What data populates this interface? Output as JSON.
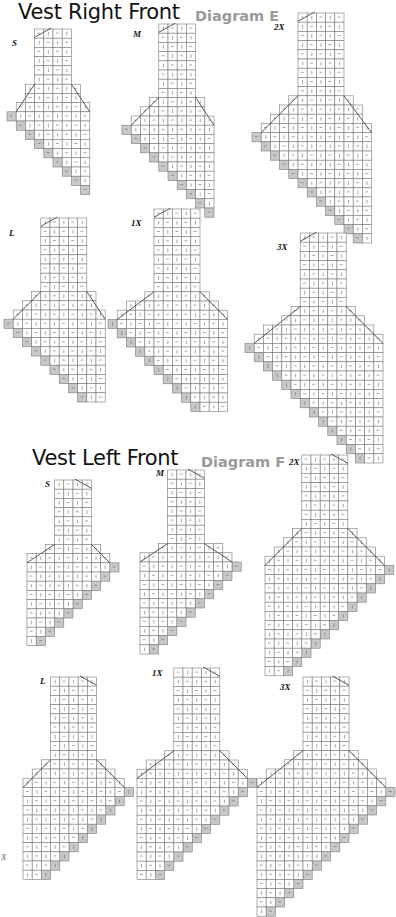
{
  "sections": [
    {
      "title": "Vest Right Front",
      "subtitle": "Diagram E"
    },
    {
      "title": "Vest Left Front",
      "subtitle": "Diagram F"
    }
  ],
  "stray_text": "X",
  "colors": {
    "line": "#7a7a7a",
    "outline": "#444444",
    "grey_cell": "#c8c8c8",
    "mark": "#666666"
  },
  "diagrams": [
    {
      "section": 0,
      "size": "S",
      "side": "right",
      "x": 7,
      "y": 29,
      "cell": 9.2,
      "neck_cols": 4,
      "neck_rows": 6,
      "body_cols": 8,
      "body_rows": 3,
      "steps": 9,
      "label_x": 12,
      "label_y": 46
    },
    {
      "section": 0,
      "size": "M",
      "side": "right",
      "x": 122,
      "y": 24,
      "cell": 9.2,
      "neck_cols": 4,
      "neck_rows": 8,
      "body_cols": 9,
      "body_rows": 3,
      "steps": 10,
      "label_x": 133,
      "label_y": 37
    },
    {
      "section": 0,
      "size": "2X",
      "side": "right",
      "x": 252,
      "y": 13,
      "cell": 9.2,
      "neck_cols": 5,
      "neck_rows": 9,
      "body_cols": 12,
      "body_rows": 4,
      "steps": 12,
      "label_x": 274,
      "label_y": 30
    },
    {
      "section": 0,
      "size": "L",
      "side": "right",
      "x": 4,
      "y": 218,
      "cell": 9.2,
      "neck_cols": 5,
      "neck_rows": 8,
      "body_cols": 10,
      "body_rows": 3,
      "steps": 9,
      "label_x": 9,
      "label_y": 236
    },
    {
      "section": 0,
      "size": "1X",
      "side": "right",
      "x": 108,
      "y": 209,
      "cell": 9.2,
      "neck_cols": 5,
      "neck_rows": 9,
      "body_cols": 12,
      "body_rows": 3,
      "steps": 10,
      "label_x": 131,
      "label_y": 226
    },
    {
      "section": 0,
      "size": "3X",
      "side": "right",
      "x": 245,
      "y": 233,
      "cell": 9.2,
      "neck_cols": 5,
      "neck_rows": 8,
      "body_cols": 14,
      "body_rows": 4,
      "steps": 13,
      "label_x": 277,
      "label_y": 250
    },
    {
      "section": 1,
      "size": "S",
      "side": "left",
      "x": 27,
      "y": 480,
      "cell": 9.2,
      "neck_cols": 4,
      "neck_rows": 7,
      "body_cols": 9,
      "body_rows": 2,
      "steps": 9,
      "label_x": 45,
      "label_y": 487
    },
    {
      "section": 1,
      "size": "M",
      "side": "left",
      "x": 140,
      "y": 470,
      "cell": 9.2,
      "neck_cols": 4,
      "neck_rows": 8,
      "body_cols": 10,
      "body_rows": 2,
      "steps": 10,
      "label_x": 156,
      "label_y": 476
    },
    {
      "section": 1,
      "size": "2X",
      "side": "left",
      "x": 265,
      "y": 455,
      "cell": 9.2,
      "neck_cols": 5,
      "neck_rows": 8,
      "body_cols": 13,
      "body_rows": 4,
      "steps": 12,
      "label_x": 289,
      "label_y": 465
    },
    {
      "section": 1,
      "size": "L",
      "side": "left",
      "x": 23,
      "y": 677,
      "cell": 9.2,
      "neck_cols": 5,
      "neck_rows": 9,
      "body_cols": 11,
      "body_rows": 3,
      "steps": 10,
      "label_x": 40,
      "label_y": 684
    },
    {
      "section": 1,
      "size": "1X",
      "side": "left",
      "x": 137,
      "y": 668,
      "cell": 9.2,
      "neck_cols": 5,
      "neck_rows": 9,
      "body_cols": 12,
      "body_rows": 3,
      "steps": 11,
      "label_x": 152,
      "label_y": 676
    },
    {
      "section": 1,
      "size": "3X",
      "side": "left",
      "x": 257,
      "y": 677,
      "cell": 9.2,
      "neck_cols": 5,
      "neck_rows": 8,
      "body_cols": 14,
      "body_rows": 4,
      "steps": 14,
      "label_x": 280,
      "label_y": 690
    }
  ]
}
